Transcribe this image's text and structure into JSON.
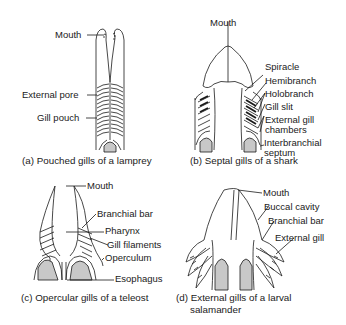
{
  "panels": [
    {
      "id": "a",
      "caption": "(a) Pouched gills of a lamprey",
      "labels": [
        "Mouth",
        "External pore",
        "Gill pouch"
      ]
    },
    {
      "id": "b",
      "caption": "(b) Septal gills of a shark",
      "labels": [
        "Mouth",
        "Spiracle",
        "Hemibranch",
        "Holobranch",
        "Gill slit",
        "External gill",
        "chambers",
        "Interbranchial",
        "septum"
      ]
    },
    {
      "id": "c",
      "caption": "(c) Opercular gills of a teleost",
      "labels": [
        "Mouth",
        "Branchial bar",
        "Pharynx",
        "Gill filaments",
        "Operculum",
        "Esophagus"
      ]
    },
    {
      "id": "d",
      "caption_line1": "(d) External gills of a larval",
      "caption_line2": "salamander",
      "labels": [
        "Mouth",
        "Buccal cavity",
        "Branchial bar",
        "External gill"
      ]
    }
  ],
  "colors": {
    "line": "#1a1a1a",
    "fill_gray": "#c8c8c8",
    "background": "#ffffff"
  }
}
